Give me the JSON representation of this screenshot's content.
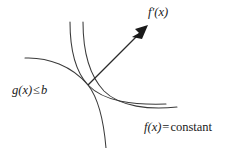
{
  "figure": {
    "type": "constrained-optimization-diagram",
    "background_color": "#ffffff",
    "stroke_color": "#3a3a3a",
    "text_color": "#1a1a1a",
    "labels": {
      "gradient": {
        "function": "f",
        "prime": "′",
        "argument": "(x)"
      },
      "constraint": {
        "function": "g",
        "argument": "(x)",
        "relation": "≤",
        "bound": "b"
      },
      "level_set": {
        "function": "f",
        "argument": "(x)",
        "relation": "=",
        "value": "constant"
      }
    },
    "curves": {
      "constraint_boundary": "g(x) = b",
      "level_curve_inner": "f(x) = constant (inner)",
      "level_curve_outer": "f(x) = constant (outer)",
      "gradient_vector": "f'(x)"
    }
  }
}
